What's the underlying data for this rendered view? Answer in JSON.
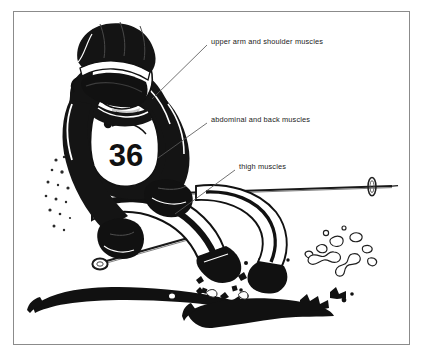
{
  "figure": {
    "kind": "labelled-illustration",
    "frame": {
      "border_color": "#8b8b8b",
      "background_color": "#ffffff"
    },
    "palette": {
      "ink": "#111111",
      "paper": "#ffffff",
      "frame": "#8b8b8b",
      "leader_line": "#5a5a5a",
      "text": "#1a1a1a"
    },
    "bib": {
      "number": "36"
    },
    "labels": [
      {
        "id": "upper-arm",
        "text": "upper arm and shoulder muscles",
        "leader": {
          "x1": 207,
          "y1": 45,
          "x2": 152,
          "y2": 99
        }
      },
      {
        "id": "abdominal",
        "text": "abdominal and back muscles",
        "leader": {
          "x1": 207,
          "y1": 123,
          "x2": 158,
          "y2": 158
        }
      },
      {
        "id": "thigh",
        "text": "thigh muscles",
        "leader": {
          "x1": 235,
          "y1": 170,
          "x2": 175,
          "y2": 214
        }
      }
    ]
  }
}
